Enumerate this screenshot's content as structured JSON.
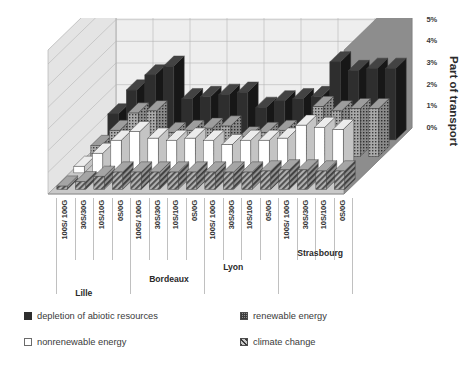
{
  "chart_data": {
    "type": "bar",
    "title": "",
    "subtitle": "",
    "xlabel": "",
    "ylabel": "Part of transport",
    "ylim": [
      0,
      6
    ],
    "ytick_labels": [
      "0%",
      "1%",
      "2%",
      "3%",
      "4%",
      "5%",
      "6%"
    ],
    "ytick_values": [
      0,
      1,
      2,
      3,
      4,
      5,
      6
    ],
    "grid": true,
    "projection": "3d",
    "legend_position": "bottom",
    "group_labels": [
      "Lille",
      "Bordeaux",
      "Lyon",
      "Strasbourg"
    ],
    "categories": [
      "100S/ 100G",
      "30S/30G",
      "10S/10G",
      "0S/0G",
      "100S/ 100G",
      "30S/30G",
      "10S/10G",
      "0S/0G",
      "100S/ 100G",
      "30S/30G",
      "10S/10G",
      "0S/0G",
      "100S/ 100G",
      "30S/30G",
      "10S/10G",
      "0S/0G"
    ],
    "series": [
      {
        "name": "depletion of abiotic resources",
        "color": "#2e2e2e",
        "pattern": "solid",
        "values": [
          1.2,
          2.3,
          3.0,
          3.4,
          1.9,
          2.0,
          2.1,
          2.2,
          1.5,
          1.8,
          1.9,
          2.0,
          3.6,
          3.2,
          3.3,
          3.3
        ]
      },
      {
        "name": "renewable energy",
        "color": "#8f8f8f",
        "pattern": "dots",
        "values": [
          0.5,
          1.2,
          2.0,
          2.1,
          1.1,
          1.2,
          1.3,
          1.4,
          0.9,
          1.1,
          1.2,
          1.3,
          2.3,
          2.1,
          2.2,
          2.2
        ]
      },
      {
        "name": "nonrenewable energy",
        "color": "#ffffff",
        "pattern": "plain",
        "values": [
          0.3,
          0.9,
          1.5,
          1.9,
          1.6,
          1.5,
          1.6,
          1.5,
          1.3,
          1.5,
          1.5,
          1.6,
          2.2,
          2.1,
          2.0,
          0.0
        ]
      },
      {
        "name": "climate change",
        "color": "#9a9a9a",
        "pattern": "hatch",
        "values": [
          0.15,
          0.35,
          0.6,
          0.8,
          0.8,
          0.8,
          0.8,
          0.8,
          0.8,
          0.8,
          0.8,
          0.85,
          0.9,
          0.9,
          0.85,
          0.85
        ]
      }
    ]
  },
  "legend": {
    "items": [
      {
        "label": "depletion of abiotic resources",
        "swatch": "sw-black"
      },
      {
        "label": "nonrenewable energy",
        "swatch": "sw-white"
      },
      {
        "label": "renewable energy",
        "swatch": "sw-dot"
      },
      {
        "label": "climate change",
        "swatch": "sw-hatch"
      }
    ]
  },
  "colors": {
    "wall_back": "#eeeeee",
    "wall_side": "#8d8d8d",
    "floor": "#c9c9c9",
    "grid": "#b6b6b6",
    "text": "#2b2b2b"
  }
}
